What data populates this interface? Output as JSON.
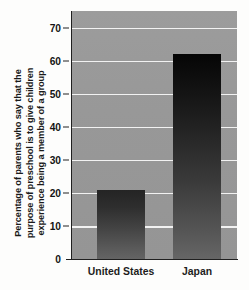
{
  "chart_data": {
    "type": "bar",
    "title": "",
    "subtitle": "",
    "categories": [
      "United States",
      "Japan"
    ],
    "values": [
      21,
      62
    ],
    "xlabel": "",
    "ylabel_lines": [
      "Percentage of parents who say that the",
      "purpose of preschool is to give children",
      "experience being a member of a group"
    ],
    "ylabel": "Percentage of parents who say that the purpose of preschool is to give children experience being a member of a group",
    "ylim": [
      0,
      75
    ],
    "yticks": [
      0,
      10,
      20,
      30,
      40,
      50,
      60,
      70
    ],
    "ytick_labels": [
      "0",
      "10",
      "20",
      "30",
      "40",
      "50",
      "60",
      "70"
    ],
    "grid": true,
    "gridlines_at": [
      10,
      20,
      30,
      40,
      50,
      60,
      70
    ],
    "legend": false,
    "legend_position": "none",
    "annotations": [],
    "colors": {
      "plot_background": "#989898",
      "gridline": "#f2f2f2",
      "bar_top": "#0a0a0a",
      "bar_bottom": "#646464",
      "axis": "#202020",
      "text": "#1a1a1a",
      "page_background": "#fdfdfc"
    }
  }
}
